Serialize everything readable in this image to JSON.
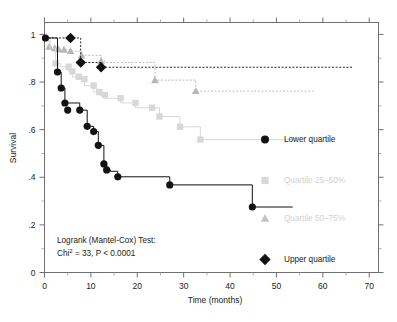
{
  "chart_data": {
    "type": "line",
    "title": "",
    "xlabel": "Time (months)",
    "ylabel": "Survival",
    "xlim": [
      0,
      72
    ],
    "ylim": [
      0,
      1.05
    ],
    "xticks": [
      0,
      10,
      20,
      30,
      40,
      50,
      60,
      70
    ],
    "xtick_labels": [
      "0",
      "10",
      "20",
      "30",
      "40",
      "50",
      "60",
      "70"
    ],
    "yticks": [
      0,
      0.2,
      0.4,
      0.6,
      0.8,
      1
    ],
    "ytick_labels": [
      "0",
      ".2",
      ".4",
      ".6",
      ".8",
      "1"
    ],
    "grid": false,
    "legend_position": "right",
    "plot_style": "kaplan-meier step",
    "series": [
      {
        "name": "Lower quartile",
        "marker": "circle",
        "color": "#121212",
        "line_style": "solid",
        "x": [
          0,
          1.5,
          2.8,
          3.6,
          4.4,
          7.6,
          9.2,
          10.6,
          11.6,
          12.8,
          13.4,
          14.2,
          15.8,
          27.0,
          44.8,
          53.5
        ],
        "y": [
          0.985,
          0.985,
          0.842,
          0.775,
          0.712,
          0.682,
          0.614,
          0.592,
          0.534,
          0.456,
          0.431,
          0.425,
          0.402,
          0.368,
          0.275,
          0.275
        ],
        "marker_x": [
          0.2,
          2.8,
          3.6,
          4.4,
          5.0,
          7.6,
          9.2,
          10.6,
          11.6,
          12.8,
          13.4,
          15.8,
          27.0,
          44.8
        ],
        "marker_y": [
          0.985,
          0.842,
          0.775,
          0.712,
          0.682,
          0.682,
          0.614,
          0.592,
          0.534,
          0.456,
          0.431,
          0.402,
          0.368,
          0.275
        ]
      },
      {
        "name": "Quartile 25–50%",
        "marker": "square",
        "color": "#d8d8d8",
        "line_style": "solid",
        "x": [
          0,
          1.2,
          2.4,
          3.4,
          5.2,
          6.0,
          7.4,
          8.6,
          10.6,
          11.8,
          13.0,
          16.4,
          19.6,
          23.2,
          24.8,
          29.2,
          33.6,
          54.0
        ],
        "y": [
          0.985,
          0.942,
          0.878,
          0.864,
          0.845,
          0.822,
          0.812,
          0.785,
          0.758,
          0.745,
          0.732,
          0.712,
          0.692,
          0.692,
          0.655,
          0.612,
          0.558,
          0.558
        ],
        "marker_x": [
          2.4,
          5.2,
          6.0,
          7.4,
          8.6,
          10.6,
          11.8,
          13.0,
          16.4,
          19.6,
          23.2,
          24.8,
          29.2,
          33.6
        ],
        "marker_y": [
          0.878,
          0.864,
          0.845,
          0.822,
          0.812,
          0.785,
          0.758,
          0.745,
          0.732,
          0.712,
          0.692,
          0.655,
          0.612,
          0.558
        ]
      },
      {
        "name": "Quartile 50–75%",
        "marker": "triangle",
        "color": "#b6b6b6",
        "line_style": "dotted",
        "x": [
          0,
          1.0,
          2.2,
          3.0,
          4.2,
          5.6,
          8.0,
          12.2,
          13.0,
          23.8,
          32.6,
          58.0
        ],
        "y": [
          0.985,
          0.948,
          0.942,
          0.938,
          0.936,
          0.93,
          0.912,
          0.888,
          0.882,
          0.808,
          0.762,
          0.762
        ],
        "marker_x": [
          1.0,
          2.2,
          3.0,
          4.2,
          5.6,
          8.0,
          12.2,
          23.8,
          32.6
        ],
        "marker_y": [
          0.948,
          0.942,
          0.938,
          0.936,
          0.93,
          0.912,
          0.888,
          0.808,
          0.762
        ]
      },
      {
        "name": "Upper quartile",
        "marker": "diamond",
        "color": "#121212",
        "line_style": "dotted",
        "x": [
          0,
          5.6,
          7.8,
          12.2,
          66.5
        ],
        "y": [
          0.985,
          0.985,
          0.882,
          0.862,
          0.862
        ],
        "marker_x": [
          5.6,
          7.8,
          12.2
        ],
        "marker_y": [
          0.985,
          0.882,
          0.862
        ]
      }
    ]
  },
  "legend": {
    "items": [
      {
        "label": "Lower quartile",
        "marker": "circle",
        "color": "#121212",
        "faint": false
      },
      {
        "label": "Quartile 25–50%",
        "marker": "square",
        "color": "#d8d8d8",
        "faint": true
      },
      {
        "label": "Quartile 50–75%",
        "marker": "triangle",
        "color": "#c4c4c4",
        "faint": true
      },
      {
        "label": "Upper quartile",
        "marker": "diamond",
        "color": "#121212",
        "faint": false
      }
    ]
  },
  "statistics": {
    "line1": "Logrank (Mantel-Cox) Test:",
    "line2_prefix": "Chi",
    "line2_sup": "2",
    "line2_rest": " = 33, P < 0.0001"
  },
  "colors": {
    "axis": "#6f6f6f",
    "black_series": "#121212",
    "square_series": "#d8d8d8",
    "triangle_series": "#b6b6b6",
    "background": "#ffffff"
  }
}
